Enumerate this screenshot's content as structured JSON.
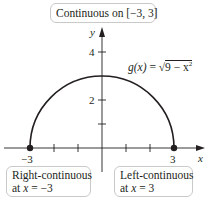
{
  "figure": {
    "title_callout": "Continuous on [−3, 3]",
    "function_label": {
      "name": "g(x)",
      "equals": "=",
      "radical": "√",
      "radicand": "9 − x",
      "exponent": "2"
    },
    "axes": {
      "x_label": "x",
      "y_label": "y",
      "x_ticks": [
        -3,
        -2,
        -1,
        1,
        2,
        3
      ],
      "x_tick_labels": {
        "neg3": "−3",
        "pos3": "3"
      },
      "y_ticks": [
        1,
        2,
        3,
        4
      ],
      "y_tick_labels": {
        "two": "2",
        "four": "4"
      }
    },
    "endpoints": [
      {
        "x": -3,
        "y": 0,
        "style": "filled"
      },
      {
        "x": 3,
        "y": 0,
        "style": "filled"
      }
    ],
    "left_callout": {
      "line1": "Right-continuous",
      "line2_prefix": "at ",
      "line2_var": "x",
      "line2_suffix": " = −3"
    },
    "right_callout": {
      "line1": "Left-continuous",
      "line2_prefix": "at ",
      "line2_var": "x",
      "line2_suffix": " = 3"
    },
    "colors": {
      "curve": "#231f20",
      "axis": "#231f20",
      "callout_border": "#c9c9c9"
    }
  }
}
